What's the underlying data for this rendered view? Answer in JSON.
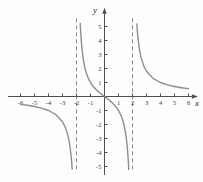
{
  "figure": {
    "background": "#fdfdfd",
    "axis_color": "#4f4f4f",
    "curve_color": "#8e8e8e",
    "asymptote_color": "#8a8a8a",
    "tick_text_color": "#3b3b3b"
  },
  "chart_data": {
    "type": "line",
    "title": "",
    "xlabel": "x",
    "ylabel": "y",
    "xlim": [
      -6.9,
      6.6
    ],
    "ylim": [
      -5.6,
      5.8
    ],
    "grid": false,
    "legend": false,
    "x_ticks": [
      -6,
      -5,
      -4,
      -3,
      -2,
      -1,
      1,
      2,
      3,
      4,
      5,
      6
    ],
    "y_ticks": [
      -5,
      -4,
      -3,
      -2,
      -1,
      1,
      2,
      3,
      4,
      5
    ],
    "function": "y = 3x / (x^2 - 4)",
    "vertical_asymptotes": [
      -2,
      2
    ],
    "series": [
      {
        "name": "left-branch",
        "points": [
          [
            -6,
            -0.563
          ],
          [
            -5.5,
            -0.629
          ],
          [
            -5,
            -0.714
          ],
          [
            -4.5,
            -0.831
          ],
          [
            -4,
            -1
          ],
          [
            -3.5,
            -1.273
          ],
          [
            -3,
            -1.8
          ],
          [
            -2.8,
            -2.188
          ],
          [
            -2.6,
            -2.826
          ],
          [
            -2.5,
            -3.333
          ],
          [
            -2.4,
            -4.091
          ],
          [
            -2.35,
            -4.631
          ],
          [
            -2.31,
            -5.187
          ]
        ]
      },
      {
        "name": "middle-branch",
        "points": [
          [
            -1.733,
            5.215
          ],
          [
            -1.72,
            4.954
          ],
          [
            -1.7,
            4.595
          ],
          [
            -1.68,
            4.28
          ],
          [
            -1.65,
            3.875
          ],
          [
            -1.6,
            3.333
          ],
          [
            -1.55,
            2.911
          ],
          [
            -1.5,
            2.571
          ],
          [
            -1.4,
            2.059
          ],
          [
            -1.3,
            1.688
          ],
          [
            -1.2,
            1.406
          ],
          [
            -1.1,
            1.183
          ],
          [
            -1,
            1
          ],
          [
            -0.9,
            0.846
          ],
          [
            -0.8,
            0.714
          ],
          [
            -0.7,
            0.598
          ],
          [
            -0.6,
            0.495
          ],
          [
            -0.5,
            0.4
          ],
          [
            -0.4,
            0.313
          ],
          [
            -0.3,
            0.23
          ],
          [
            -0.2,
            0.152
          ],
          [
            -0.1,
            0.075
          ],
          [
            0,
            0
          ],
          [
            0.1,
            -0.075
          ],
          [
            0.2,
            -0.152
          ],
          [
            0.3,
            -0.23
          ],
          [
            0.4,
            -0.313
          ],
          [
            0.5,
            -0.4
          ],
          [
            0.6,
            -0.495
          ],
          [
            0.7,
            -0.598
          ],
          [
            0.8,
            -0.714
          ],
          [
            0.9,
            -0.846
          ],
          [
            1,
            -1
          ],
          [
            1.1,
            -1.183
          ],
          [
            1.2,
            -1.406
          ],
          [
            1.3,
            -1.688
          ],
          [
            1.4,
            -2.059
          ],
          [
            1.5,
            -2.571
          ],
          [
            1.55,
            -2.911
          ],
          [
            1.6,
            -3.333
          ],
          [
            1.65,
            -3.875
          ],
          [
            1.68,
            -4.28
          ],
          [
            1.7,
            -4.595
          ],
          [
            1.72,
            -4.954
          ],
          [
            1.733,
            -5.215
          ]
        ]
      },
      {
        "name": "right-branch",
        "points": [
          [
            2.31,
            5.187
          ],
          [
            2.35,
            4.631
          ],
          [
            2.4,
            4.091
          ],
          [
            2.5,
            3.333
          ],
          [
            2.6,
            2.826
          ],
          [
            2.8,
            2.188
          ],
          [
            3,
            1.8
          ],
          [
            3.5,
            1.273
          ],
          [
            4,
            1
          ],
          [
            4.5,
            0.831
          ],
          [
            5,
            0.714
          ],
          [
            5.5,
            0.629
          ],
          [
            6,
            0.563
          ]
        ]
      }
    ]
  }
}
